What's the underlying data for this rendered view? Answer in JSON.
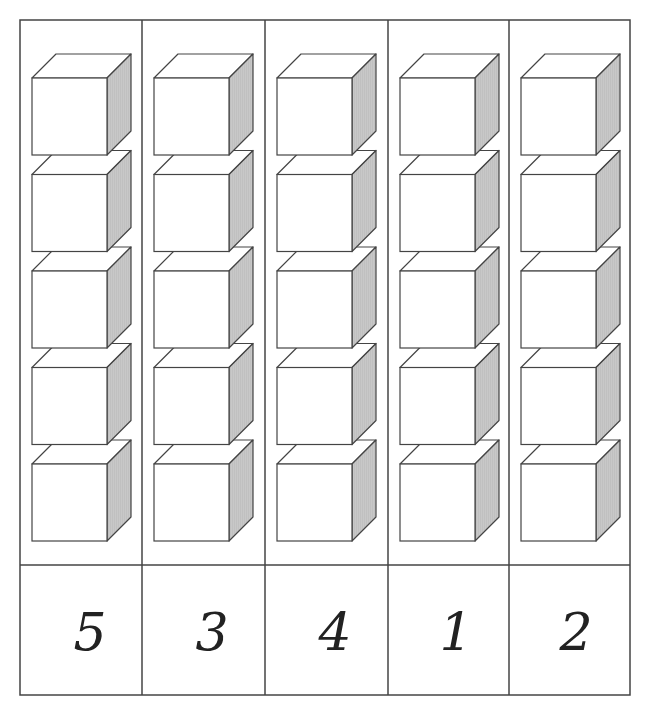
{
  "worksheet": {
    "grid": {
      "left": 20,
      "top": 20,
      "right": 630,
      "bottom": 695,
      "divider_y": 565,
      "column_x": [
        20,
        142,
        265,
        388,
        509,
        630
      ]
    },
    "columns": [
      {
        "cubes": 5,
        "number": "5"
      },
      {
        "cubes": 5,
        "number": "3"
      },
      {
        "cubes": 5,
        "number": "4"
      },
      {
        "cubes": 5,
        "number": "1"
      },
      {
        "cubes": 5,
        "number": "2"
      }
    ],
    "colors": {
      "line": "#444444",
      "cube_face": "#ffffff",
      "cube_side": "#c8c8c8",
      "number": "#222222"
    }
  }
}
